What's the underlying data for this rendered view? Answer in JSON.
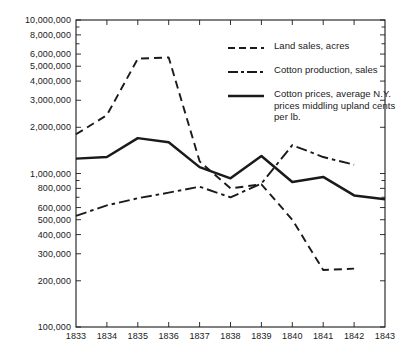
{
  "chart_data": {
    "type": "line",
    "title": "",
    "subtitle": "",
    "xlabel": "",
    "ylabel": "",
    "yscale": "log",
    "ylim": [
      100000,
      10000000
    ],
    "xlim": [
      1833,
      1843
    ],
    "grid": false,
    "legend_position": "inside-upper-right",
    "x": [
      1833,
      1834,
      1835,
      1836,
      1837,
      1838,
      1839,
      1840,
      1841,
      1842,
      1843
    ],
    "y_ticks": [
      100000,
      200000,
      300000,
      400000,
      500000,
      600000,
      800000,
      1000000,
      2000000,
      3000000,
      4000000,
      5000000,
      6000000,
      8000000,
      10000000
    ],
    "y_tick_labels": [
      "100,000",
      "200,000",
      "300,000",
      "400,000",
      "500,000",
      "600,000",
      "800,000",
      "1,000,000",
      "2,000,000",
      "3,000,000",
      "4,000,000",
      "5,000,000",
      "6,000,000",
      "8,000,000",
      "10,000,000"
    ],
    "y_minor_ticks": [
      700000,
      900000,
      7000000,
      9000000
    ],
    "x_tick_labels": [
      "1833",
      "1834",
      "1835",
      "1836",
      "1837",
      "1838",
      "1839",
      "1840",
      "1841",
      "1842",
      "1843"
    ],
    "series": [
      {
        "name": "Land sales, acres",
        "style": "dashed",
        "color": "#1a1a1a",
        "x": [
          1833,
          1834,
          1835,
          1836,
          1837,
          1838,
          1839,
          1840,
          1841,
          1842
        ],
        "values": [
          1800000,
          2400000,
          5600000,
          5700000,
          1200000,
          800000,
          850000,
          500000,
          235000,
          240000
        ]
      },
      {
        "name": "Cotton production, sales",
        "style": "dash-dot",
        "color": "#1a1a1a",
        "x": [
          1833,
          1834,
          1835,
          1836,
          1837,
          1838,
          1839,
          1840,
          1841,
          1842
        ],
        "values": [
          530000,
          620000,
          690000,
          750000,
          820000,
          700000,
          860000,
          1530000,
          1280000,
          1140000
        ]
      },
      {
        "name": "Cotton prices, average N.Y. prices middling upland cents per lb.",
        "style": "solid",
        "color": "#1a1a1a",
        "x": [
          1833,
          1834,
          1835,
          1836,
          1837,
          1838,
          1839,
          1840,
          1841,
          1842,
          1843
        ],
        "values": [
          1250000,
          1280000,
          1700000,
          1600000,
          1100000,
          930000,
          1300000,
          880000,
          950000,
          720000,
          680000
        ]
      }
    ]
  },
  "legend": {
    "items": [
      {
        "label": "Land sales, acres",
        "style": "dashed"
      },
      {
        "label": "Cotton production, sales",
        "style": "dash-dot"
      },
      {
        "label": "Cotton prices, average N.Y.  prices middling upland cents per lb.",
        "style": "solid"
      }
    ]
  }
}
